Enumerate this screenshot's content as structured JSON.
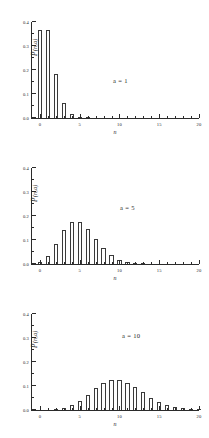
{
  "figure": {
    "background": "#ffffff",
    "line_color": "#2b2b2b",
    "bar_edge_color": "#3a3a3a",
    "bar_fill_color": "#ffffff"
  },
  "axis": {
    "ylabel_prefix": "P",
    "ylabel_suffix": "(n,a)",
    "xlabel": "n",
    "y_ticks": [
      "0.0",
      "0.1",
      "0.2",
      "0.3",
      "0.4"
    ],
    "y_tick_values": [
      0.0,
      0.1,
      0.2,
      0.3,
      0.4
    ],
    "x_ticks": [
      "0",
      "5",
      "10",
      "15",
      "20"
    ],
    "x_tick_values": [
      0,
      5,
      10,
      15,
      20
    ]
  },
  "chart_data": [
    {
      "type": "bar",
      "title": "",
      "annotation": "a = 1",
      "annotation_param": "a",
      "annotation_value": "1",
      "xlabel": "n",
      "ylabel": "P(n,a)",
      "xlim": [
        -1,
        20
      ],
      "ylim": [
        0.0,
        0.4
      ],
      "grid": false,
      "legend": "none",
      "categories": [
        0,
        1,
        2,
        3,
        4,
        5,
        6,
        7,
        8,
        9,
        10,
        11,
        12,
        13,
        14,
        15,
        16,
        17,
        18,
        19,
        20
      ],
      "values": [
        0.368,
        0.368,
        0.184,
        0.061,
        0.015,
        0.003,
        0.001,
        0.0,
        0.0,
        0.0,
        0.0,
        0.0,
        0.0,
        0.0,
        0.0,
        0.0,
        0.0,
        0.0,
        0.0,
        0.0,
        0.0
      ]
    },
    {
      "type": "bar",
      "title": "",
      "annotation": "a = 5",
      "annotation_param": "a",
      "annotation_value": "5",
      "xlabel": "n",
      "ylabel": "P(n,a)",
      "xlim": [
        -1,
        20
      ],
      "ylim": [
        0.0,
        0.4
      ],
      "grid": false,
      "legend": "none",
      "categories": [
        0,
        1,
        2,
        3,
        4,
        5,
        6,
        7,
        8,
        9,
        10,
        11,
        12,
        13,
        14,
        15,
        16,
        17,
        18,
        19,
        20
      ],
      "values": [
        0.007,
        0.034,
        0.084,
        0.14,
        0.175,
        0.175,
        0.146,
        0.104,
        0.065,
        0.036,
        0.018,
        0.008,
        0.003,
        0.001,
        0.0,
        0.0,
        0.0,
        0.0,
        0.0,
        0.0,
        0.0
      ]
    },
    {
      "type": "bar",
      "title": "",
      "annotation": "a = 10",
      "annotation_param": "a",
      "annotation_value": "10",
      "xlabel": "n",
      "ylabel": "P(n,a)",
      "xlim": [
        -1,
        20
      ],
      "ylim": [
        0.0,
        0.4
      ],
      "grid": false,
      "legend": "none",
      "categories": [
        0,
        1,
        2,
        3,
        4,
        5,
        6,
        7,
        8,
        9,
        10,
        11,
        12,
        13,
        14,
        15,
        16,
        17,
        18,
        19,
        20
      ],
      "values": [
        0.0,
        0.0,
        0.002,
        0.008,
        0.019,
        0.038,
        0.063,
        0.09,
        0.113,
        0.125,
        0.125,
        0.114,
        0.095,
        0.073,
        0.052,
        0.035,
        0.022,
        0.013,
        0.007,
        0.004,
        0.002
      ]
    }
  ]
}
